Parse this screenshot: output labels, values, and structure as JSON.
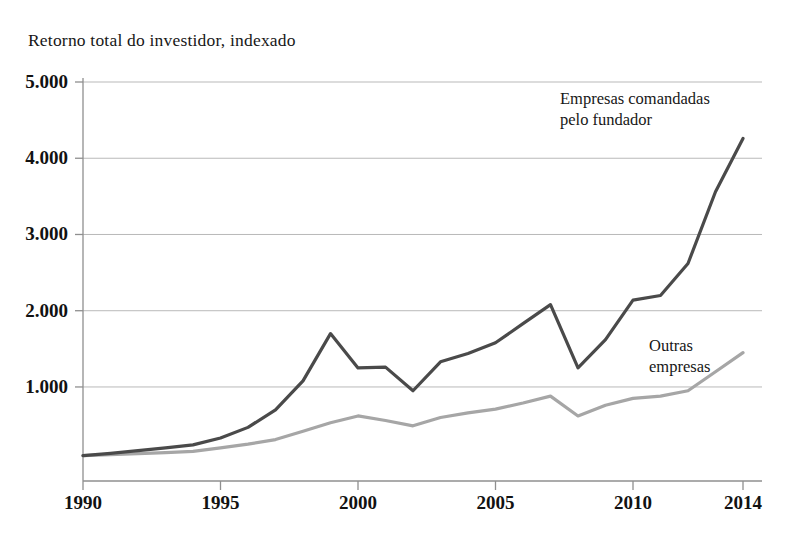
{
  "chart_data": {
    "type": "line",
    "title": "Retorno total do investidor, indexado",
    "xlabel": "",
    "ylabel": "",
    "grid": true,
    "legend_position": "inline-annotation",
    "xlim": [
      1990,
      2014
    ],
    "ylim": [
      0,
      5000
    ],
    "y_ticks": [
      1000,
      2000,
      3000,
      4000,
      5000
    ],
    "y_tick_labels": [
      "1.000",
      "2.000",
      "3.000",
      "4.000",
      "5.000"
    ],
    "x_ticks": [
      1990,
      1995,
      2000,
      2005,
      2010,
      2014
    ],
    "x_tick_labels": [
      "1990",
      "1995",
      "2000",
      "2005",
      "2010",
      "2014"
    ],
    "x": [
      1990,
      1991,
      1992,
      1993,
      1994,
      1995,
      1996,
      1997,
      1998,
      1999,
      2000,
      2001,
      2002,
      2003,
      2004,
      2005,
      2006,
      2007,
      2008,
      2009,
      2010,
      2011,
      2012,
      2013,
      2014
    ],
    "series": [
      {
        "name": "Empresas comandadas pelo fundador",
        "color": "#4a4a4a",
        "width": 3.2,
        "values": [
          100,
          130,
          165,
          200,
          240,
          330,
          470,
          700,
          1080,
          1700,
          1250,
          1260,
          950,
          1330,
          1440,
          1580,
          1830,
          2080,
          1250,
          1620,
          2140,
          2200,
          2620,
          3560,
          4260
        ]
      },
      {
        "name": "Outras empresas",
        "color": "#a6a6a6",
        "width": 3.2,
        "values": [
          100,
          112,
          125,
          140,
          155,
          200,
          250,
          310,
          420,
          530,
          620,
          560,
          490,
          600,
          660,
          710,
          790,
          880,
          620,
          760,
          850,
          880,
          950,
          1200,
          1450
        ]
      }
    ],
    "annotations": [
      {
        "text_line1": "Empresas comandadas",
        "text_line2": "pelo fundador",
        "series": "Empresas comandadas pelo fundador"
      },
      {
        "text_line1": "Outras",
        "text_line2": "empresas",
        "series": "Outras empresas"
      }
    ]
  },
  "colors": {
    "founder_line": "#4a4a4a",
    "others_line": "#a6a6a6",
    "grid": "#b9b9b9",
    "axis": "#8f8f8f",
    "text": "#171717",
    "background": "#ffffff"
  }
}
